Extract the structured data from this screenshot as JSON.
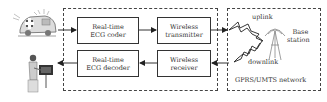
{
  "diagram": {
    "blocks": [
      {
        "id": "coder",
        "line1": "Real-time",
        "line2": "ECG coder"
      },
      {
        "id": "transmitter",
        "line1": "Wireless",
        "line2": "transmitter"
      },
      {
        "id": "decoder",
        "line1": "Real-time",
        "line2": "ECG decoder"
      },
      {
        "id": "receiver",
        "line1": "Wireless",
        "line2": "receiver"
      }
    ],
    "network": {
      "uplink": "uplink",
      "downlink": "downlink",
      "base_station_line1": "Base",
      "base_station_line2": "station",
      "network_label": "GPRS/UMTS network"
    },
    "icons": {
      "source": "ambulance-icon",
      "destination": "doctor-at-monitor-icon",
      "tower": "antenna-tower-icon"
    },
    "colors": {
      "line": "#333333",
      "dashed": "#444444",
      "background": "#ffffff"
    }
  }
}
